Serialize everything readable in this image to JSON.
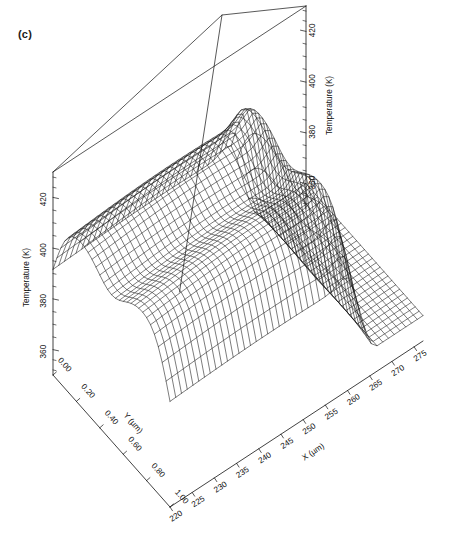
{
  "figure": {
    "panel_label": "(c)",
    "type": "3d-wireframe-surface",
    "background": "#ffffff",
    "line_color": "#111111"
  },
  "axes": {
    "z_left": {
      "title": "Temperature (K)",
      "ticks": [
        "360",
        "380",
        "400",
        "420"
      ],
      "values": [
        360,
        380,
        400,
        420
      ],
      "range": [
        350,
        430
      ],
      "minor_per_major": 4
    },
    "z_right": {
      "title": "Temperature (K)",
      "ticks": [
        "360",
        "380",
        "400",
        "420"
      ],
      "values": [
        360,
        380,
        400,
        420
      ],
      "range": [
        350,
        430
      ],
      "minor_per_major": 4
    },
    "x": {
      "title": "X (µm)",
      "ticks": [
        "220",
        "225",
        "230",
        "235",
        "240",
        "245",
        "250",
        "255",
        "260",
        "265",
        "270",
        "275"
      ],
      "values": [
        220,
        225,
        230,
        235,
        240,
        245,
        250,
        255,
        260,
        265,
        270,
        275
      ],
      "range": [
        220,
        277
      ]
    },
    "y": {
      "title": "Y (µm)",
      "ticks": [
        "0.00",
        "0.20",
        "0.40",
        "0.60",
        "0.80",
        "1.00"
      ],
      "values": [
        0.0,
        0.2,
        0.4,
        0.6,
        0.8,
        1.0
      ],
      "range": [
        0.0,
        1.0
      ]
    }
  },
  "chart_data": {
    "type": "surface",
    "title": "",
    "xlabel": "X (µm)",
    "ylabel": "Y (µm)",
    "zlabel": "Temperature (K)",
    "xlim": [
      220,
      277
    ],
    "ylim": [
      0.0,
      1.0
    ],
    "zlim": [
      350,
      430
    ],
    "grid": false,
    "legend": "none",
    "x": [
      220,
      222,
      224,
      226,
      228,
      230,
      232,
      234,
      236,
      238,
      240,
      242,
      244,
      246,
      248,
      250,
      252,
      254,
      256,
      258,
      260,
      262,
      264,
      266,
      268,
      270,
      272,
      274,
      276
    ],
    "y": [
      0.0,
      0.04,
      0.08,
      0.12,
      0.16,
      0.2,
      0.24,
      0.28,
      0.32,
      0.36,
      0.4,
      0.44,
      0.48,
      0.52,
      0.56,
      0.6,
      0.64,
      0.68,
      0.72,
      0.76,
      0.8,
      0.84,
      0.88,
      0.92,
      0.96,
      1.0
    ],
    "surface_model": {
      "description": "Plateau of elevated temperature over low-X region falling steeply to baseline near X=262-272; narrow ridge crest with a shallow notch near Y=0.5",
      "baseline_K": 360,
      "plateau_K": 412,
      "peak_K": 424,
      "notch_depth_K": 8,
      "edge_x_um": 263,
      "edge_width_um": 7,
      "ridge_center_y": 0.5,
      "ridge_half_width_y": 0.52
    },
    "z_samples": {
      "note": "Temperature (K) sampled on a coarse grid; rows are Y, columns are X",
      "x_cols": [
        220,
        230,
        240,
        250,
        258,
        262,
        266,
        270,
        274,
        276
      ],
      "y_rows": [
        0.0,
        0.2,
        0.4,
        0.6,
        0.8,
        1.0
      ],
      "values": [
        [
          418,
          419,
          420,
          420,
          418,
          409,
          383,
          365,
          361,
          360
        ],
        [
          416,
          417,
          418,
          418,
          416,
          407,
          382,
          365,
          361,
          360
        ],
        [
          411,
          412,
          413,
          413,
          411,
          403,
          380,
          364,
          361,
          360
        ],
        [
          412,
          413,
          414,
          414,
          412,
          404,
          381,
          365,
          361,
          360
        ],
        [
          416,
          417,
          418,
          418,
          416,
          407,
          382,
          365,
          361,
          360
        ],
        [
          418,
          419,
          420,
          420,
          418,
          409,
          383,
          365,
          361,
          360
        ]
      ]
    }
  },
  "geometry": {
    "note": "projection anchors in screenshot pixel coordinates",
    "origin_left": [
      53,
      375
    ],
    "front_corner": [
      170,
      507
    ],
    "right_corner": [
      423,
      341
    ],
    "apex": [
      222,
      15
    ],
    "z_top_left": [
      53,
      172
    ],
    "z_top_right": [
      423,
      163
    ]
  }
}
